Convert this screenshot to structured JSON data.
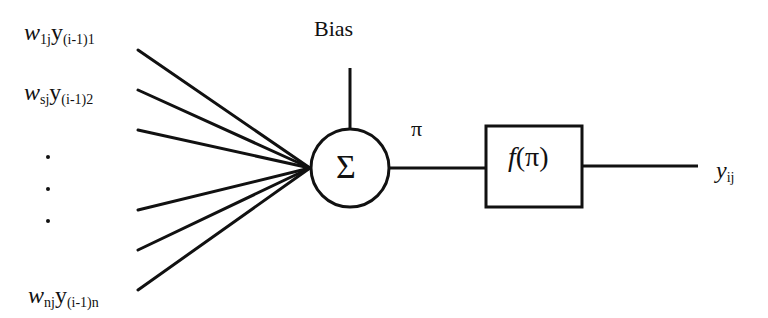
{
  "diagram": {
    "type": "artificial-neuron",
    "inputs": [
      {
        "weight": "w",
        "weight_sub": "1j",
        "signal": "y",
        "signal_sub": "(i-1)1"
      },
      {
        "weight": "w",
        "weight_sub": "sj",
        "signal": "y",
        "signal_sub": "(i-1)2"
      },
      {
        "weight": "w",
        "weight_sub": "nj",
        "signal": "y",
        "signal_sub": "(i-1)n"
      }
    ],
    "ellipsis_dots": 3,
    "bias_label": "Bias",
    "summation_symbol": "Σ",
    "net_label": "π",
    "activation_label": "f(π)",
    "output": {
      "symbol": "y",
      "sub": "ij"
    },
    "colors": {
      "stroke": "#111111",
      "background": "#ffffff"
    }
  }
}
